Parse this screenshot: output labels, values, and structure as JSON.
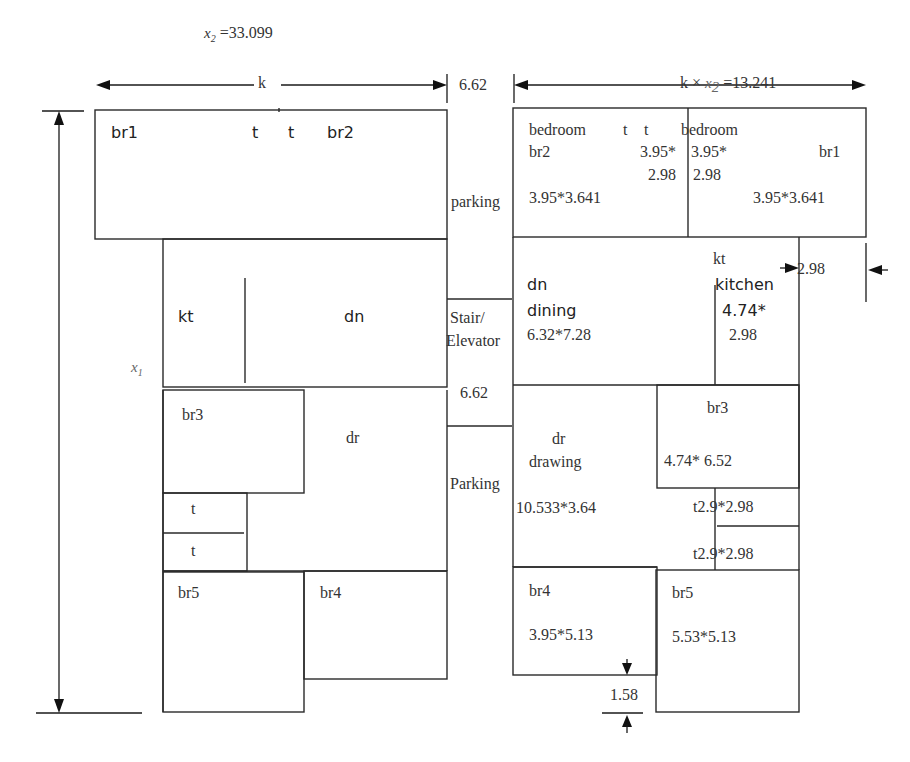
{
  "header": {
    "x2_label": "x",
    "x2_sub": "2",
    "x2_value": " =33.099"
  },
  "dimensions": {
    "left_width_label": "k",
    "gap_width": "6.62",
    "right_width_k": "k ×",
    "right_width_x": "x",
    "right_width_sub": "2",
    "right_width_value": " =13.241",
    "height_label": "x",
    "height_sub": "1",
    "kitchen_offset": "2.98",
    "br4_offset": "1.58"
  },
  "left_plan": {
    "rooms": {
      "br1": "br1",
      "t1": "t",
      "t2": "t",
      "br2": "br2",
      "kt": "kt",
      "dn": "dn",
      "br3": "br3",
      "dr": "dr",
      "t3": "t",
      "t4": "t",
      "br5": "br5",
      "br4": "br4"
    }
  },
  "center_strip": {
    "parking_top": "parking",
    "stair": "Stair/",
    "elevator": "Elevator",
    "stair_width": "6.62",
    "parking_bottom": "Parking"
  },
  "right_plan": {
    "bedroom_left": {
      "name": "bedroom",
      "code": "br2",
      "size": "3.95*3.641"
    },
    "toilets_top": {
      "t1": "t",
      "t2": "t",
      "size_a": "3.95*",
      "size_b": "2.98",
      "size_c": "3.95*",
      "size_d": "2.98"
    },
    "bedroom_right": {
      "name": "bedroom",
      "code": "br1",
      "size": "3.95*3.641"
    },
    "dining": {
      "code": "dn",
      "name": "dining",
      "size": "6.32*7.28"
    },
    "kitchen": {
      "code": "kt",
      "name": "kitchen",
      "size_a": "4.74*",
      "size_b": "2.98"
    },
    "drawing": {
      "code": "dr",
      "name": "drawing",
      "size": "10.533*3.64"
    },
    "br3": {
      "code": "br3",
      "size": "4.74* 6.52"
    },
    "toilet_a": {
      "label": "t2.9*2.98"
    },
    "toilet_b": {
      "label": "t2.9*2.98"
    },
    "br4": {
      "code": "br4",
      "size": "3.95*5.13"
    },
    "br5": {
      "code": "br5",
      "size": "5.53*5.13"
    }
  }
}
